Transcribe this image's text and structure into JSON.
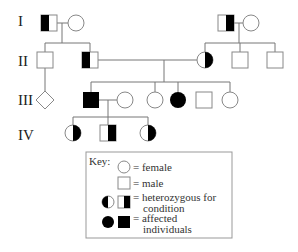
{
  "generations": [
    {
      "label": "I"
    },
    {
      "label": "II"
    },
    {
      "label": "III"
    },
    {
      "label": "IV"
    }
  ],
  "individuals": [
    {
      "id": "I-1",
      "generation": "I",
      "sex": "male",
      "status": "heterozygous"
    },
    {
      "id": "I-2",
      "generation": "I",
      "sex": "female",
      "status": "unaffected"
    },
    {
      "id": "I-3",
      "generation": "I",
      "sex": "male",
      "status": "heterozygous"
    },
    {
      "id": "I-4",
      "generation": "I",
      "sex": "female",
      "status": "unaffected"
    },
    {
      "id": "II-1",
      "generation": "II",
      "sex": "male",
      "status": "unaffected"
    },
    {
      "id": "II-2",
      "generation": "II",
      "sex": "male",
      "status": "heterozygous"
    },
    {
      "id": "II-3",
      "generation": "II",
      "sex": "female",
      "status": "heterozygous"
    },
    {
      "id": "II-4",
      "generation": "II",
      "sex": "male",
      "status": "unaffected"
    },
    {
      "id": "II-5",
      "generation": "II",
      "sex": "male",
      "status": "unaffected"
    },
    {
      "id": "III-1",
      "generation": "III",
      "sex": "unknown",
      "status": "unaffected"
    },
    {
      "id": "III-2",
      "generation": "III",
      "sex": "male",
      "status": "affected"
    },
    {
      "id": "III-3",
      "generation": "III",
      "sex": "female",
      "status": "unaffected"
    },
    {
      "id": "III-4",
      "generation": "III",
      "sex": "female",
      "status": "unaffected"
    },
    {
      "id": "III-5",
      "generation": "III",
      "sex": "female",
      "status": "affected"
    },
    {
      "id": "III-6",
      "generation": "III",
      "sex": "male",
      "status": "unaffected"
    },
    {
      "id": "III-7",
      "generation": "III",
      "sex": "female",
      "status": "unaffected"
    },
    {
      "id": "IV-1",
      "generation": "IV",
      "sex": "female",
      "status": "heterozygous"
    },
    {
      "id": "IV-2",
      "generation": "IV",
      "sex": "male",
      "status": "heterozygous"
    },
    {
      "id": "IV-3",
      "generation": "IV",
      "sex": "female",
      "status": "heterozygous"
    }
  ],
  "key": {
    "title": "Key:",
    "female": "= female",
    "male": "= male",
    "heterozygous_line1": "= heterozygous for",
    "heterozygous_line2": "condition",
    "affected_line1": "= affected",
    "affected_line2": "individuals"
  }
}
